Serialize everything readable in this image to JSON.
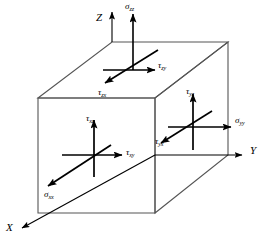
{
  "figure": {
    "background_color": "#ffffff",
    "line_color": "#000000",
    "box_edge_color": "#4a4a4a",
    "width": 270,
    "height": 243
  },
  "axes": [
    {
      "name": "z-axis",
      "label": "Z",
      "label_x": 96,
      "label_y": 12,
      "direction": "up"
    },
    {
      "name": "y-axis",
      "label": "Y",
      "label_x": 250,
      "label_y": 145,
      "direction": "right"
    },
    {
      "name": "x-axis",
      "label": "X",
      "label_x": 6,
      "label_y": 222,
      "direction": "down-left"
    }
  ],
  "stresses": [
    {
      "name": "sigma-zz",
      "symbol": "σ",
      "subscript": "zz",
      "face": "top",
      "direction": "up",
      "label_x": 125,
      "label_y": 2
    },
    {
      "name": "tau-zy",
      "symbol": "τ",
      "subscript": "zy",
      "face": "top",
      "direction": "right",
      "label_x": 158,
      "label_y": 61
    },
    {
      "name": "tau-zx",
      "symbol": "τ",
      "subscript": "zx",
      "face": "top",
      "direction": "down-left",
      "label_x": 98,
      "label_y": 88
    },
    {
      "name": "tau-xz",
      "symbol": "τ",
      "subscript": "xz",
      "face": "front",
      "direction": "up",
      "label_x": 86,
      "label_y": 114
    },
    {
      "name": "tau-xy",
      "symbol": "τ",
      "subscript": "xy",
      "face": "front",
      "direction": "right",
      "label_x": 126,
      "label_y": 148
    },
    {
      "name": "sigma-xx",
      "symbol": "σ",
      "subscript": "xx",
      "face": "front",
      "direction": "down-left",
      "label_x": 44,
      "label_y": 190
    },
    {
      "name": "tau-yz",
      "symbol": "τ",
      "symbol_alt": "τ",
      "subscript": "yz",
      "face": "right",
      "direction": "up",
      "label_x": 186,
      "label_y": 87
    },
    {
      "name": "sigma-yy",
      "symbol": "σ",
      "subscript": "yy",
      "face": "right",
      "direction": "right",
      "label_x": 235,
      "label_y": 116
    },
    {
      "name": "tau-yx",
      "symbol": "τ",
      "subscript": "yx",
      "face": "right",
      "direction": "down-left",
      "label_x": 155,
      "label_y": 137
    }
  ],
  "geometry": {
    "box": {
      "front_top_left": [
        38,
        98
      ],
      "front_top_right": [
        155,
        98
      ],
      "front_bottom_left": [
        38,
        213
      ],
      "front_bottom_right": [
        155,
        213
      ],
      "back_top_left": [
        112,
        42
      ],
      "back_top_right": [
        228,
        42
      ],
      "back_bottom_right": [
        228,
        155
      ]
    },
    "centers": {
      "top_face": [
        133,
        70
      ],
      "front_face": [
        94,
        155
      ],
      "right_face": [
        193,
        127
      ]
    },
    "origin": [
      155,
      155
    ]
  }
}
